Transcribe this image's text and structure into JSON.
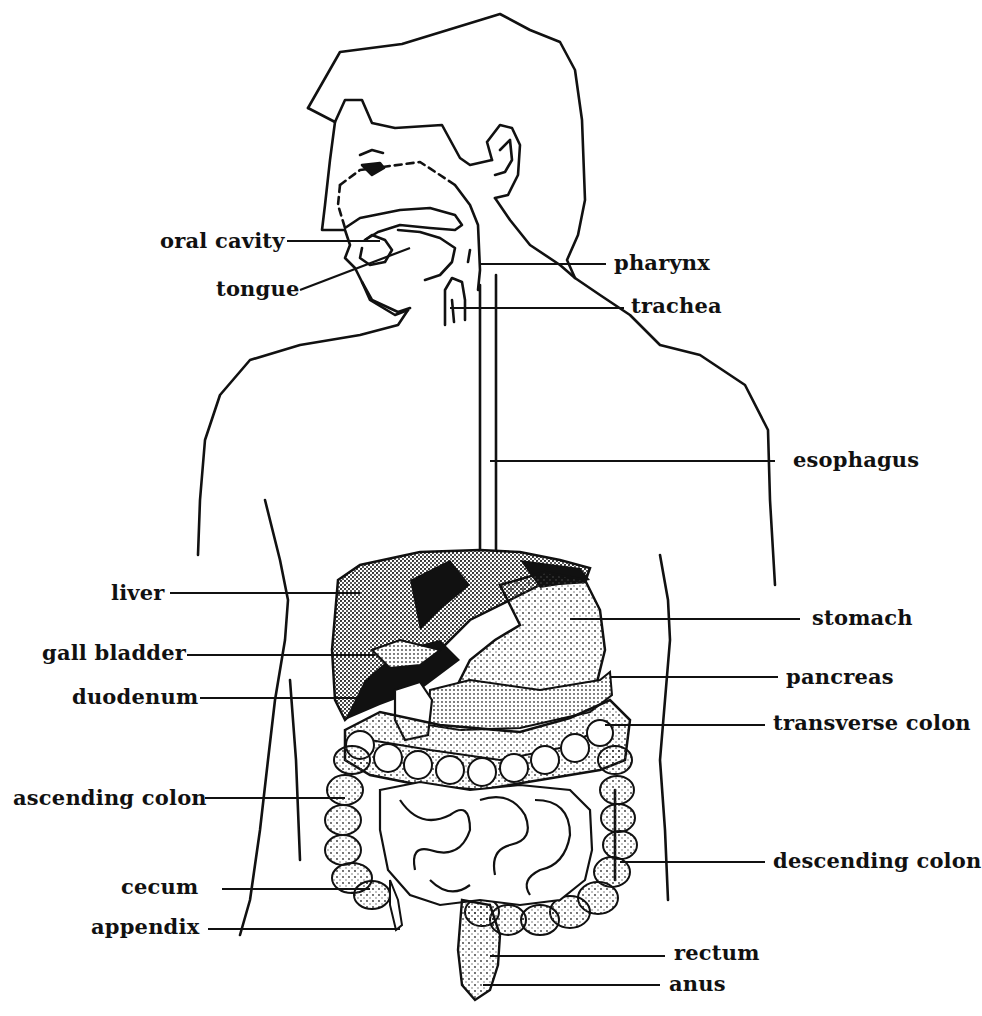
{
  "diagram": {
    "type": "anatomical-line-illustration",
    "colors": {
      "ink": "#111111",
      "background": "#ffffff",
      "stipple": "#555555"
    },
    "labels_left": [
      {
        "id": "oral-cavity",
        "text": "oral cavity"
      },
      {
        "id": "tongue",
        "text": "tongue"
      },
      {
        "id": "liver",
        "text": "liver"
      },
      {
        "id": "gall-bladder",
        "text": "gall bladder"
      },
      {
        "id": "duodenum",
        "text": "duodenum"
      },
      {
        "id": "ascending-colon",
        "text": "ascending colon"
      },
      {
        "id": "cecum",
        "text": "cecum"
      },
      {
        "id": "appendix",
        "text": "appendix"
      }
    ],
    "labels_right": [
      {
        "id": "pharynx",
        "text": "pharynx"
      },
      {
        "id": "trachea",
        "text": "trachea"
      },
      {
        "id": "esophagus",
        "text": "esophagus"
      },
      {
        "id": "stomach",
        "text": "stomach"
      },
      {
        "id": "pancreas",
        "text": "pancreas"
      },
      {
        "id": "transverse-colon",
        "text": "transverse colon"
      },
      {
        "id": "descending-colon",
        "text": "descending colon"
      },
      {
        "id": "rectum",
        "text": "rectum"
      },
      {
        "id": "anus",
        "text": "anus"
      }
    ]
  }
}
